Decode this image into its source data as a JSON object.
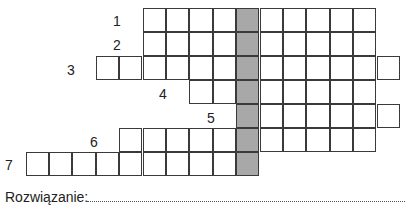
{
  "puzzle": {
    "grid": {
      "origin_x": 26,
      "origin_y": 8,
      "cell_w": 23.4,
      "cell_h": 24,
      "solution_column": 9,
      "shade_color": "#a8a8a8",
      "rows": [
        {
          "number": "1",
          "start_col": 5,
          "end_col": 14,
          "label_x": 113,
          "label_y": 14
        },
        {
          "number": "2",
          "start_col": 5,
          "end_col": 14,
          "label_x": 113,
          "label_y": 38
        },
        {
          "number": "3",
          "start_col": 3,
          "end_col": 15,
          "label_x": 67,
          "label_y": 63
        },
        {
          "number": "4",
          "start_col": 7,
          "end_col": 14,
          "label_x": 159,
          "label_y": 87
        },
        {
          "number": "5",
          "start_col": 9,
          "end_col": 15,
          "label_x": 207,
          "label_y": 111
        },
        {
          "number": "6",
          "start_col": 4,
          "end_col": 14,
          "label_x": 90,
          "label_y": 135
        },
        {
          "number": "7",
          "start_col": 0,
          "end_col": 9,
          "label_x": 5,
          "label_y": 158
        }
      ]
    },
    "solution_label": "Rozwiązanie:"
  }
}
